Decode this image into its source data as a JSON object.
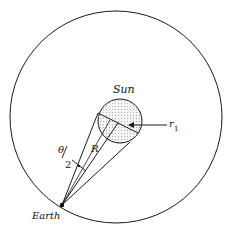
{
  "diagram": {
    "type": "geometry",
    "labels": {
      "sun": "Sun",
      "earth": "Earth",
      "radius": "R",
      "r1": "r",
      "r1_sub": "1",
      "theta": "θ",
      "theta_div": "2"
    },
    "colors": {
      "stroke": "#1a1a1a",
      "background": "#ffffff",
      "sun_dots": "#555555"
    },
    "geometry": {
      "orbit": {
        "cx": 116,
        "cy": 117,
        "r": 106
      },
      "sun": {
        "cx": 120,
        "cy": 121,
        "r": 22
      },
      "earth": {
        "x": 62,
        "y": 205
      }
    }
  }
}
